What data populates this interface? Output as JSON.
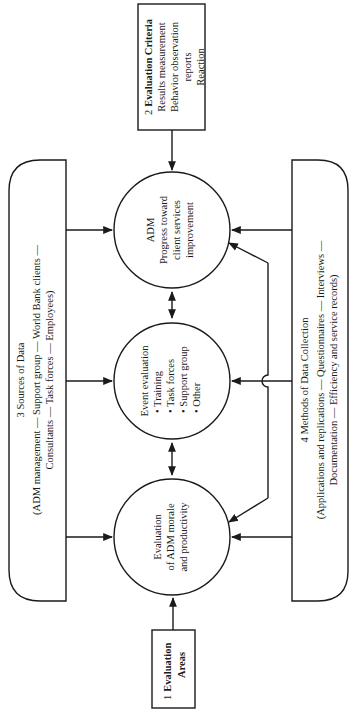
{
  "diagram": {
    "colors": {
      "ink": "#1a1a1a",
      "background": "#ffffff"
    },
    "boxes": {
      "evaluation_areas": {
        "number": "1",
        "title": "Evaluation",
        "title2": "Areas"
      },
      "evaluation_criteria": {
        "number": "2",
        "title": "Evaluation Criteria",
        "lines": [
          "Results measurement",
          "Behavior observation",
          "reports",
          "Reaction"
        ]
      },
      "sources_of_data": {
        "title": "3 Sources of Data",
        "lines": [
          "(ADM management — Support group — World Bank clients —",
          "Consultants — Task forces — Employees)"
        ]
      },
      "methods_of_data_collection": {
        "title": "4 Methods of Data Collection",
        "lines": [
          "(Applications and replications — Questionnaires — Interviews —",
          "Documentation — Efficiency and service records)"
        ]
      }
    },
    "circles": {
      "progress": {
        "lines": [
          "ADM",
          "Progress toward",
          "client services",
          "improvement"
        ]
      },
      "event": {
        "title": "Event evaluation",
        "items": [
          "• Training",
          "• Task forces",
          "• Support group",
          "• Other"
        ]
      },
      "morale": {
        "lines": [
          "Evaluation",
          "of ADM morale",
          "and productivity"
        ]
      }
    }
  }
}
